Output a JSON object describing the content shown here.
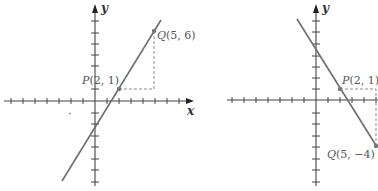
{
  "figures": [
    {
      "id": "left",
      "axes": {
        "x_label": "x",
        "y_label": "y"
      },
      "points": {
        "P": {
          "label": "P",
          "coords": "(2, 1)",
          "x": 2,
          "y": 1
        },
        "Q": {
          "label": "Q",
          "coords": "(5, 6)",
          "x": 5,
          "y": 6
        }
      },
      "slope_description": "rising line through P and Q"
    },
    {
      "id": "right",
      "axes": {
        "y_label": "y"
      },
      "points": {
        "P": {
          "label": "P",
          "coords": "(2, 1)",
          "x": 2,
          "y": 1
        },
        "Q": {
          "label": "Q",
          "coords": "(5, −4)",
          "x": 5,
          "y": -4
        }
      },
      "slope_description": "falling line through P and Q"
    }
  ],
  "colors": {
    "axis": "#444444",
    "line": "#6e6e6e",
    "dash": "#8a8a8a"
  }
}
